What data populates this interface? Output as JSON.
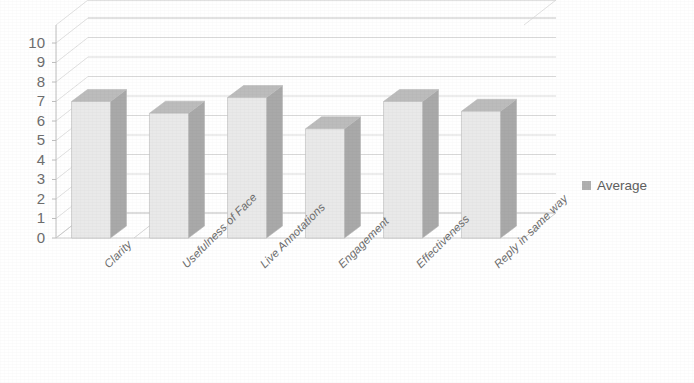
{
  "chart_data": {
    "type": "bar",
    "title": "",
    "subtitle": "",
    "xlabel": "",
    "ylabel": "",
    "categories": [
      "Clarity",
      "Usefulness of Face",
      "Live Annotations",
      "Engagement",
      "Effectiveness",
      "Reply in same way"
    ],
    "series": [
      {
        "name": "Average",
        "values": [
          7.0,
          6.4,
          7.2,
          5.6,
          7.0,
          6.5
        ]
      }
    ],
    "values": [
      7.0,
      6.4,
      7.2,
      5.6,
      7.0,
      6.5
    ],
    "ylim": [
      0,
      10
    ],
    "y_ticks": [
      0,
      1,
      2,
      3,
      4,
      5,
      6,
      7,
      8,
      9,
      10
    ],
    "y_tick_labels": [
      "0",
      "1",
      "2",
      "3",
      "4",
      "5",
      "6",
      "7",
      "8",
      "9",
      "10"
    ],
    "grid": true,
    "grid_axis": "y",
    "legend": [
      "Average"
    ],
    "legend_position": "right",
    "style": "3d-column",
    "annotations": []
  },
  "legend": {
    "entries": [
      {
        "label": "Average",
        "color": "#b0b0b0"
      }
    ]
  },
  "axis": {
    "y_labels": [
      "10",
      "9",
      "8",
      "7",
      "6",
      "5",
      "4",
      "3",
      "2",
      "1",
      "0"
    ],
    "x_labels": [
      "Clarity",
      "Usefulness of Face",
      "Live Annotations",
      "Engagement",
      "Effectiveness",
      "Reply in same way"
    ]
  },
  "colors": {
    "bar_front": "#e9e9e9",
    "bar_side": "#a9a9a9",
    "bar_top": "#bcbcbc",
    "gridline": "#d2d2d2",
    "axis": "#c0c0c0",
    "text": "#6d6d6d",
    "background": "#ffffff"
  }
}
